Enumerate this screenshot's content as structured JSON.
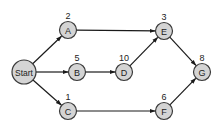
{
  "diagram": {
    "type": "directed-graph",
    "nodes": [
      {
        "id": "Start",
        "label": "Start",
        "weight": "",
        "x": 24,
        "y": 72,
        "r": 12
      },
      {
        "id": "A",
        "label": "A",
        "weight": "2",
        "x": 68,
        "y": 30,
        "r": 8.5
      },
      {
        "id": "B",
        "label": "B",
        "weight": "5",
        "x": 77,
        "y": 72,
        "r": 8.5
      },
      {
        "id": "C",
        "label": "C",
        "weight": "1",
        "x": 68,
        "y": 111,
        "r": 8.5
      },
      {
        "id": "D",
        "label": "D",
        "weight": "10",
        "x": 124,
        "y": 72,
        "r": 8.5
      },
      {
        "id": "E",
        "label": "E",
        "weight": "3",
        "x": 164,
        "y": 31,
        "r": 8.5
      },
      {
        "id": "F",
        "label": "F",
        "weight": "6",
        "x": 164,
        "y": 111,
        "r": 8.5
      },
      {
        "id": "G",
        "label": "G",
        "weight": "8",
        "x": 202,
        "y": 72,
        "r": 8.5
      }
    ],
    "edges": [
      {
        "from": "Start",
        "to": "A"
      },
      {
        "from": "Start",
        "to": "B"
      },
      {
        "from": "Start",
        "to": "C"
      },
      {
        "from": "A",
        "to": "E"
      },
      {
        "from": "B",
        "to": "D"
      },
      {
        "from": "D",
        "to": "E"
      },
      {
        "from": "C",
        "to": "F"
      },
      {
        "from": "E",
        "to": "G"
      },
      {
        "from": "F",
        "to": "G"
      }
    ]
  },
  "colors": {
    "node_fill": "#d4d4d4",
    "node_stroke": "#3a3a3a",
    "edge": "#1a1a1a",
    "background": "#ffffff"
  }
}
